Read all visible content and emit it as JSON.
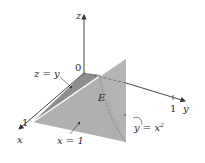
{
  "figure": {
    "region_label": "E",
    "axes": {
      "x": {
        "label": "x",
        "tick": "1"
      },
      "y": {
        "label": "y",
        "tick": "1"
      },
      "z": {
        "label": "z"
      },
      "origin": "0"
    },
    "surfaces": [
      {
        "name": "z=y",
        "label": "z = y"
      },
      {
        "name": "x=1",
        "label": "x = 1"
      },
      {
        "name": "y=x^2",
        "label": "y = x",
        "exponent": "2"
      }
    ],
    "colors": {
      "top_face": "#c4c4c4",
      "front_face": "#b0b0b0",
      "dark_face": "#8c8c8c",
      "right_face": "#d4d4d4",
      "axis": "#333333"
    }
  }
}
